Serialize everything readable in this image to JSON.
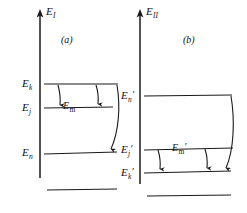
{
  "figure": {
    "type": "energy-level-diagram",
    "background_color": "#ffffff",
    "line_color": "#1a1a1a",
    "width": 247,
    "height": 213,
    "panels": [
      {
        "id": "a",
        "caption": "(a)",
        "axis_label": "E",
        "axis_subscript": "I",
        "levels": [
          {
            "name": "E",
            "subscript": "k",
            "prime": "",
            "label_text": "E",
            "y": 84
          },
          {
            "name": "E",
            "subscript": "j",
            "prime": "",
            "label_text": "E",
            "y": 108
          },
          {
            "name": "E",
            "subscript": "n",
            "prime": "",
            "label_text": "E",
            "y": 154
          },
          {
            "name": "",
            "subscript": "",
            "prime": "",
            "label_text": "",
            "y": 190
          }
        ],
        "transition_label": "E",
        "transition_subscript": "m",
        "transition_prime": "",
        "arrows": [
          {
            "from_level": 0,
            "to_level": 1,
            "kind": "short-down"
          },
          {
            "from_level": 0,
            "to_level": 1,
            "kind": "short-down"
          },
          {
            "from_level": 0,
            "to_level": 2,
            "kind": "long-curved-down"
          }
        ]
      },
      {
        "id": "b",
        "caption": "(b)",
        "axis_label": "E",
        "axis_subscript": "II",
        "levels": [
          {
            "name": "E",
            "subscript": "n",
            "prime": "′",
            "label_text": "E",
            "y": 96
          },
          {
            "name": "E",
            "subscript": "j",
            "prime": "′",
            "label_text": "E",
            "y": 150
          },
          {
            "name": "E",
            "subscript": "k",
            "prime": "′",
            "label_text": "E",
            "y": 173
          },
          {
            "name": "",
            "subscript": "",
            "prime": "",
            "label_text": "",
            "y": 196
          }
        ],
        "transition_label": "E",
        "transition_subscript": "m",
        "transition_prime": "′",
        "arrows": [
          {
            "from_level": 1,
            "to_level": 2,
            "kind": "short-down"
          },
          {
            "from_level": 1,
            "to_level": 2,
            "kind": "short-down"
          },
          {
            "from_level": 0,
            "to_level": 2,
            "kind": "long-curved-down"
          }
        ]
      }
    ]
  }
}
